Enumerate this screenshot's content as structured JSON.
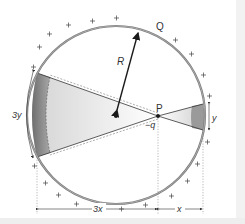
{
  "figure": {
    "type": "electrostatics-shell-diagram",
    "labels": {
      "Q": "Q",
      "R": "R",
      "P": "P",
      "charge": "−q",
      "left_height": "3y",
      "right_height": "y",
      "left_distance": "3x",
      "right_distance": "x"
    },
    "surface_charge_sign": "+",
    "colors": {
      "shell": "#7a7a7a",
      "cone_dark": "#8c8c8c",
      "cone_light": "#e6e6e6",
      "ink": "#1a1a1a"
    }
  }
}
